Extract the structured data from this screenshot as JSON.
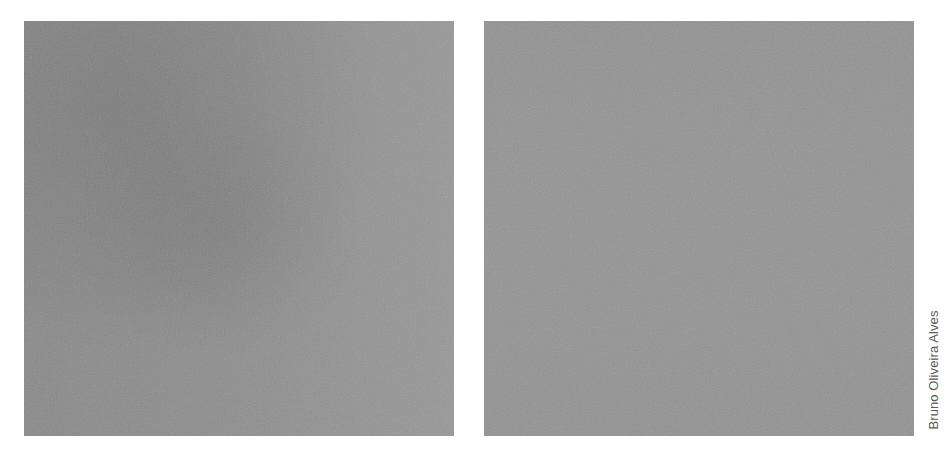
{
  "image": {
    "description": "Two side-by-side square gray noise texture panels",
    "panels": [
      {
        "id": "left",
        "base_color": "#8f8f8f",
        "dark_tone": "#858585",
        "light_tone": "#9a9a9a"
      },
      {
        "id": "right",
        "base_color": "#939393"
      }
    ],
    "background_color": "#ffffff"
  },
  "credit": {
    "text": "Bruno Oliveira Alves",
    "color": "#5a5a5a",
    "orientation": "vertical-bottom-to-top"
  }
}
